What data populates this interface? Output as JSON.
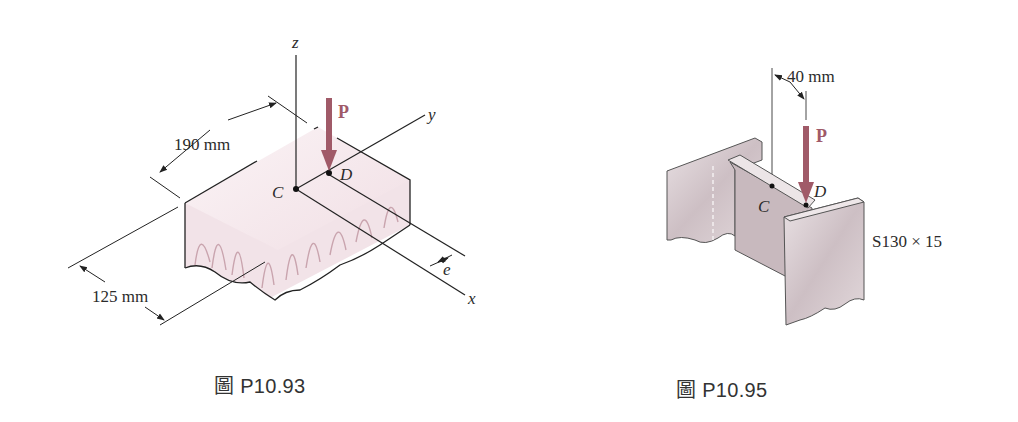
{
  "figures": [
    {
      "caption": "圖 P10.93",
      "labels": {
        "z_axis": "z",
        "y_axis": "y",
        "x_axis": "x",
        "load": "P",
        "point_c": "C",
        "point_d": "D",
        "eccentricity": "e",
        "width_dim": "190 mm",
        "depth_dim": "125 mm"
      },
      "colors": {
        "load_arrow": "#a05a68",
        "block_fill": "#f3e6ea",
        "grain": "#c9a4ae"
      }
    },
    {
      "caption": "圖 P10.95",
      "labels": {
        "load": "P",
        "point_c": "C",
        "point_d": "D",
        "offset_dim": "40 mm",
        "section": "S130 × 15"
      },
      "colors": {
        "load_arrow": "#a05a68",
        "steel_fill": "#d8ccd0",
        "steel_dark": "#b3a5aa"
      }
    }
  ]
}
